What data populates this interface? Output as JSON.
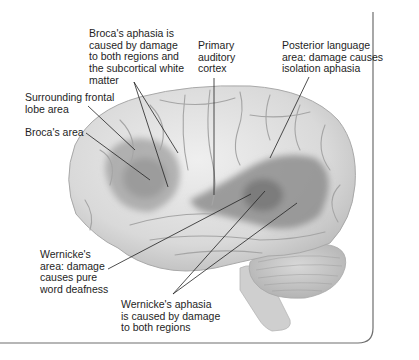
{
  "figure": {
    "colors": {
      "brain_base": "#dcdcdc",
      "brain_highlight": "#efefef",
      "sulcus": "#a9a9a9",
      "region_shading": "#8f8f8f",
      "region_dark": "#7a7a7a",
      "leader_line": "#222222",
      "frame": "#6e6e6e"
    },
    "labels": {
      "brocas_aphasia": {
        "lines": [
          "Broca's aphasia is",
          "caused by damage",
          "to both regions and",
          "the subcortical white",
          "matter"
        ]
      },
      "primary_auditory": {
        "lines": [
          "Primary",
          "auditory",
          "cortex"
        ]
      },
      "posterior_language": {
        "lines": [
          "Posterior language",
          "area: damage causes",
          "isolation aphasia"
        ]
      },
      "surrounding_frontal": {
        "lines": [
          "Surrounding frontal",
          "lobe area"
        ]
      },
      "brocas_area": {
        "lines": [
          "Broca's area"
        ]
      },
      "wernickes_area": {
        "lines": [
          "Wernicke's",
          "area: damage",
          "causes pure",
          "word deafness"
        ]
      },
      "wernickes_aphasia": {
        "lines": [
          "Wernicke's aphasia",
          "is caused by damage",
          "to both regions"
        ]
      }
    }
  }
}
